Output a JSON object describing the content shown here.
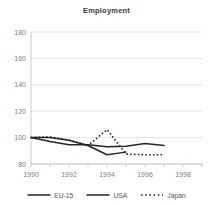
{
  "chart_data": {
    "type": "line",
    "title": "Employment",
    "xlabel": "",
    "ylabel": "",
    "xlim": [
      1990,
      1999
    ],
    "ylim": [
      80,
      180
    ],
    "yticks": [
      80,
      100,
      120,
      140,
      160,
      180
    ],
    "xticks": [
      1990,
      1992,
      1994,
      1996,
      1998
    ],
    "xticks_minor": [
      1991,
      1993,
      1995,
      1997,
      1999
    ],
    "grid": true,
    "grid_axis": "y",
    "legend_position": "bottom",
    "series": [
      {
        "name": "EU-15",
        "style": "solid",
        "color": "#262626",
        "x": [
          1990,
          1991,
          1992,
          1993,
          1994,
          1995,
          1996,
          1997
        ],
        "values": [
          100,
          97,
          94.5,
          94.5,
          93,
          93.5,
          95.5,
          94
        ]
      },
      {
        "name": "USA",
        "style": "solid",
        "color": "#262626",
        "x": [
          1990,
          1991,
          1992,
          1993,
          1994,
          1995
        ],
        "values": [
          100,
          100,
          98,
          94,
          87,
          89
        ]
      },
      {
        "name": "Japan",
        "style": "dotted",
        "color": "#262626",
        "x": [
          1990,
          1991,
          1992,
          1993,
          1994,
          1995,
          1996,
          1997
        ],
        "values": [
          100,
          100.5,
          98,
          94,
          106,
          87.5,
          87,
          87
        ]
      }
    ]
  },
  "title": {
    "text": "Employment"
  },
  "axes": {
    "y_labels": [
      "180",
      "160",
      "140",
      "120",
      "100",
      "80"
    ],
    "x_labels": [
      "1990",
      "1992",
      "1994",
      "1996",
      "1998"
    ]
  },
  "legend": {
    "items": [
      {
        "label": "EU-15",
        "style": "solid"
      },
      {
        "label": "USA",
        "style": "solid"
      },
      {
        "label": "Japan",
        "style": "dotted"
      }
    ]
  }
}
